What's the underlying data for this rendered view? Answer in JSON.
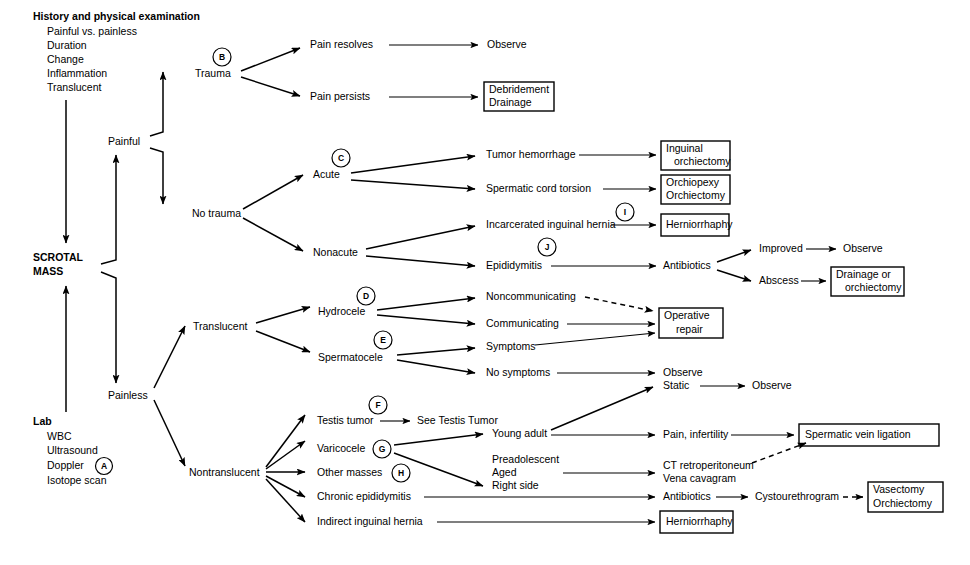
{
  "root": {
    "label_line1": "SCROTAL",
    "label_line2": "MASS"
  },
  "workup": {
    "heading": "History and physical examination",
    "items": [
      "Painful vs. painless",
      "Duration",
      "Change",
      "Inflammation",
      "Translucent"
    ]
  },
  "lab": {
    "heading": "Lab",
    "items": [
      "WBC",
      "Ultrasound",
      "Doppler",
      "Isotope scan"
    ],
    "doppler_note": "A"
  },
  "branches": {
    "painful": "Painful",
    "painless": "Painless",
    "trauma": "Trauma",
    "no_trauma": "No trauma",
    "acute": "Acute",
    "nonacute": "Nonacute",
    "translucent": "Translucent",
    "nontranslucent": "Nontranslucent"
  },
  "nodes": {
    "pain_resolves": "Pain resolves",
    "pain_persists": "Pain persists",
    "observe_1": "Observe",
    "tumor_hemorrhage": "Tumor hemorrhage",
    "spermatic_cord_torsion": "Spermatic cord torsion",
    "incarcerated_inguinal_hernia": "Incarcerated inguinal hernia",
    "epididymitis": "Epididymitis",
    "antibiotics_1": "Antibiotics",
    "improved": "Improved",
    "abscess": "Abscess",
    "observe_2": "Observe",
    "hydrocele": "Hydrocele",
    "spermatocele": "Spermatocele",
    "noncommunicating": "Noncommunicating",
    "communicating": "Communicating",
    "symptoms": "Symptoms",
    "no_symptoms": "No symptoms",
    "observe_3": "Observe",
    "static": "Static",
    "observe_4": "Observe",
    "testis_tumor": "Testis tumor",
    "see_testis_tumor": "See Testis Tumor",
    "varicocele": "Varicocele",
    "other_masses": "Other masses",
    "chronic_epididymitis": "Chronic epididymitis",
    "indirect_inguinal_hernia": "Indirect inguinal hernia",
    "young_adult": "Young adult",
    "preadolescent": "Preadolescent",
    "aged": "Aged",
    "right_side": "Right side",
    "pain_infertility": "Pain, infertility",
    "ct_retroperitoneum": "CT retroperitoneum",
    "vena_cavagram": "Vena cavagram",
    "antibiotics_2": "Antibiotics",
    "cystourethrogram": "Cystourethrogram"
  },
  "boxes": {
    "debridement_drainage": {
      "line1": "Debridement",
      "line2": "Drainage"
    },
    "inguinal_orchiectomy": {
      "line1": "Inguinal",
      "line2": "orchiectomy"
    },
    "orchiopexy_orchiectomy": {
      "line1": "Orchiopexy",
      "line2": "Orchiectomy"
    },
    "herniorrhaphy_top": {
      "line1": "Herniorrhaphy"
    },
    "drainage_or_orchiectomy": {
      "line1": "Drainage or",
      "line2": "orchiectomy"
    },
    "operative_repair": {
      "line1": "Operative",
      "line2": "repair"
    },
    "spermatic_vein_ligation": {
      "line1": "Spermatic vein ligation"
    },
    "vasectomy_orchiectomy": {
      "line1": "Vasectomy",
      "line2": "Orchiectomy"
    },
    "herniorrhaphy_bottom": {
      "line1": "Herniorrhaphy"
    }
  },
  "annotations": {
    "a": "A",
    "b": "B",
    "c": "C",
    "d": "D",
    "e": "E",
    "f": "F",
    "g": "G",
    "h": "H",
    "i": "I",
    "j": "J"
  },
  "colors": {
    "stroke": "#000000",
    "background": "#ffffff",
    "text": "#000000"
  }
}
